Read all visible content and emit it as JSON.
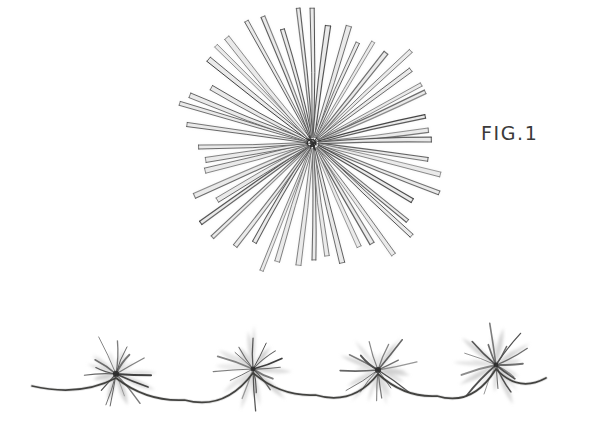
{
  "sheet": {
    "background_color": "#ffffff",
    "medium": "pencil-drawing",
    "width": 595,
    "height": 434
  },
  "labels": {
    "figure_1": "FIG.1"
  },
  "palette": {
    "ink_dark": "#3a3a3a",
    "ink_mid": "#5e5e5e",
    "ink_light": "#9a9a9a",
    "wash_pale": "#c9c9c9",
    "wash_faint": "#dedede",
    "paper": "#ffffff"
  },
  "figures": [
    {
      "id": "radial-starburst",
      "name": "fig1-starburst",
      "center": {
        "x": 313,
        "y": 143
      },
      "ray_count": 48,
      "inner_radius": 6,
      "outer_radius_min": 108,
      "outer_radius_max": 140,
      "ray_width": 4.2,
      "label": "FIG.1"
    },
    {
      "id": "wavy-stem-row",
      "name": "fig2-wavy-stem-with-bursts",
      "stem": {
        "start": {
          "x": 32,
          "y": 386
        },
        "end": {
          "x": 546,
          "y": 378
        },
        "wave_count": 4,
        "stroke_width": 1.7
      },
      "bursts": [
        {
          "x": 116,
          "y": 374,
          "radius": 34,
          "ray_count": 15
        },
        {
          "x": 253,
          "y": 369,
          "radius": 36,
          "ray_count": 15
        },
        {
          "x": 378,
          "y": 370,
          "radius": 33,
          "ray_count": 14
        },
        {
          "x": 496,
          "y": 365,
          "radius": 35,
          "ray_count": 15
        }
      ]
    }
  ]
}
